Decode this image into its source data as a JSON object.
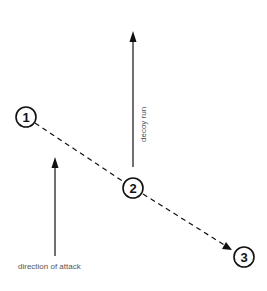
{
  "diagram": {
    "type": "tactical-play-diagram",
    "colors": {
      "line": "#111111",
      "text": "#555555",
      "background": "#ffffff"
    },
    "nodes": [
      {
        "id": "1",
        "label": "1",
        "x": 26,
        "y": 117,
        "r": 10
      },
      {
        "id": "2",
        "label": "2",
        "x": 133,
        "y": 188,
        "r": 10
      },
      {
        "id": "3",
        "label": "3",
        "x": 244,
        "y": 257,
        "r": 10
      }
    ],
    "arrows": {
      "decoy_run": {
        "label": "decoy run",
        "x": 133,
        "y_start": 167,
        "y_end": 32,
        "style": "solid"
      },
      "direction_of_attack": {
        "label": "direction of attack",
        "x": 55,
        "y_start": 256,
        "y_end": 158,
        "style": "solid"
      },
      "pass_path": {
        "from": "1",
        "via": "2",
        "to": "3",
        "style": "dashed"
      }
    },
    "labels": {
      "decoy_run": "decoy run",
      "direction_of_attack": "direction of attack"
    }
  }
}
